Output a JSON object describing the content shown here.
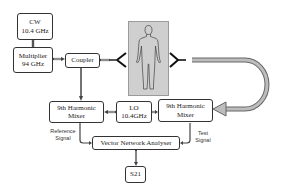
{
  "diagram": {
    "title": "",
    "nodes": {
      "cw": {
        "line1": "CW",
        "line2": "10.4 GHz"
      },
      "multiplier": {
        "line1": "Multiplier",
        "line2": "94 GHz"
      },
      "coupler": {
        "line1": "Coupler"
      },
      "subject": {
        "description": "human-body-silhouette"
      },
      "mixer_ref": {
        "line1": "9th Harmonic",
        "line2": "Mixer"
      },
      "lo": {
        "line1": "LO",
        "line2": "10.4GHz"
      },
      "mixer_test": {
        "line1": "9th Harmonic",
        "line2": "Mixer"
      },
      "vna": {
        "line1": "Vector Network Analyser"
      },
      "s21": {
        "line1": "S21"
      }
    },
    "labels": {
      "reference_signal": {
        "line1": "Reference",
        "line2": "Signal"
      },
      "test_signal": {
        "line1": "Test",
        "line2": "Signal"
      }
    },
    "edges": [
      {
        "from": "cw",
        "to": "multiplier"
      },
      {
        "from": "multiplier",
        "to": "coupler"
      },
      {
        "from": "coupler",
        "to": "tx-horn"
      },
      {
        "from": "coupler",
        "to": "mixer_ref"
      },
      {
        "from": "rx-horn",
        "to": "mixer_test",
        "style": "waveguide-pipe"
      },
      {
        "from": "lo",
        "to": "mixer_ref"
      },
      {
        "from": "lo",
        "to": "mixer_test"
      },
      {
        "from": "mixer_ref",
        "to": "vna",
        "label": "Reference Signal"
      },
      {
        "from": "mixer_test",
        "to": "vna",
        "label": "Test Signal"
      },
      {
        "from": "vna",
        "to": "s21"
      }
    ],
    "colors": {
      "line": "#333333",
      "panel": "#cfcfcf",
      "pipe": "#9a9a9a"
    }
  }
}
